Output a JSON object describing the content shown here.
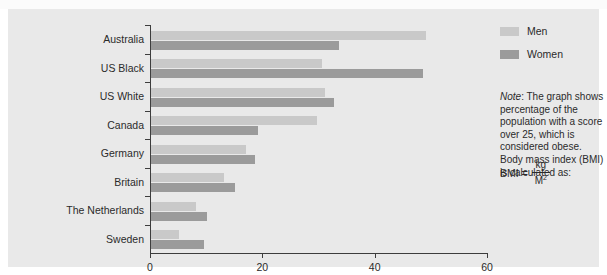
{
  "figure": {
    "background_color": "#e9e9e9",
    "bar_colors": {
      "men": "#c9c9c9",
      "women": "#9b9b9b"
    },
    "axis_color": "#3d3d3d"
  },
  "legend": {
    "position": "top-right",
    "items": [
      {
        "label": "Men",
        "color": "#c9c9c9"
      },
      {
        "label": "Women",
        "color": "#9b9b9b"
      }
    ]
  },
  "note": {
    "lead_word": "Note",
    "text": ": The graph shows percentage of the population with a score over 25, which is considered obese. Body mass index (BMI) is calculated as:",
    "formula": {
      "lhs": "BMI =",
      "numerator": "kg",
      "denominator": "M",
      "denominator_exponent": "2"
    }
  },
  "chart_data": {
    "type": "bar",
    "orientation": "horizontal",
    "title": "",
    "xlabel": "",
    "ylabel": "",
    "xlim": [
      0,
      60
    ],
    "xticks": [
      0,
      20,
      40,
      60
    ],
    "xtick_labels": [
      "0",
      "20",
      "40",
      "60"
    ],
    "grid": false,
    "categories": [
      "Australia",
      "US Black",
      "US White",
      "Canada",
      "Germany",
      "Britain",
      "The Netherlands",
      "Sweden"
    ],
    "series": [
      {
        "name": "Men",
        "color": "#c9c9c9",
        "values": [
          49,
          30.5,
          31,
          29.5,
          17,
          13,
          8,
          5
        ]
      },
      {
        "name": "Women",
        "color": "#9b9b9b",
        "values": [
          33.5,
          48.5,
          32.5,
          19,
          18.5,
          15,
          10,
          9.5
        ]
      }
    ]
  }
}
